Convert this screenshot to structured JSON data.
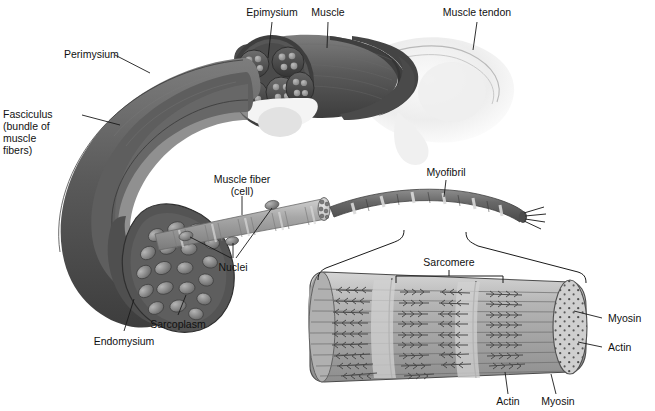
{
  "figure": {
    "background_color": "#ffffff",
    "label_color": "#111111",
    "leader_line_color": "#1a1a1a"
  },
  "labels": {
    "epimysium": "Epimysium",
    "muscle": "Muscle",
    "muscle_tendon": "Muscle tendon",
    "perimysium": "Perimysium",
    "fasciculus_l1": "Fasciculus",
    "fasciculus_l2": "(bundle of",
    "fasciculus_l3": "muscle",
    "fasciculus_l4": "fibers)",
    "muscle_fiber_l1": "Muscle fiber",
    "muscle_fiber_l2": "(cell)",
    "nuclei": "Nuclei",
    "myofibril": "Myofibril",
    "sarcoplasm": "Sarcoplasm",
    "endomysium": "Endomysium",
    "sarcomere": "Sarcomere",
    "myosin_right": "Myosin",
    "actin_right": "Actin",
    "actin_bottom": "Actin",
    "myosin_bottom": "Myosin"
  },
  "palette": {
    "muscle_dark": "#4d4d4d",
    "muscle_mid": "#6e6e6e",
    "muscle_light": "#8f8f8f",
    "fiber_grey": "#9a9a9a",
    "fiber_light": "#c2c2c2",
    "tendon_pale": "#f2f2f2",
    "myofibril_band_dark": "#5c5c5c",
    "myofibril_band_light": "#d8d8d8",
    "sarcomere_fill": "#b8b8b8",
    "sarcomere_stripe": "#8d8d8d",
    "outline": "#2b2b2b"
  },
  "structures": {
    "muscle_belly": "tapered muscle belly with epimysium sheath",
    "cross_section": "cut end showing fascicle bundles of muscle fibers",
    "fascicle_count": 5,
    "tendon": "pale tendon attaching to bone",
    "muscle_fiber": "striated cylindrical cell with surface nuclei",
    "nuclei_count": 3,
    "myofibril": "banded myofibril strand with frayed filament end",
    "sarcomere_segments": 3,
    "filament_rows": 9,
    "end_cap": "cross-section dotted with thick and thin filaments"
  }
}
